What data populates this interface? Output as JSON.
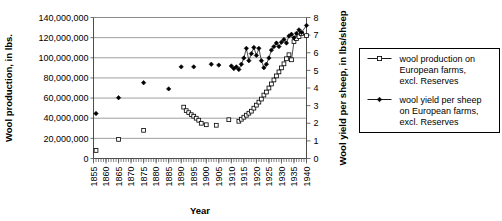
{
  "chart_data": {
    "type": "scatter",
    "title": "",
    "xlabel": "Year",
    "ylabel": "Wool production, in lbs.",
    "y2label": "Wool yield per sheep, in lbs/sheep",
    "xlim": [
      1855,
      1940
    ],
    "ylim": [
      0,
      140000000
    ],
    "y2lim": [
      0,
      8
    ],
    "grid": true,
    "legend_position": "right",
    "x_ticks": [
      1855,
      1860,
      1865,
      1870,
      1875,
      1880,
      1885,
      1890,
      1895,
      1900,
      1905,
      1910,
      1915,
      1920,
      1925,
      1930,
      1935,
      1940
    ],
    "x_tick_labels": [
      "1855",
      "1860",
      "1865",
      "1870",
      "1875",
      "1880",
      "1885",
      "1890",
      "1895",
      "1900",
      "1905",
      "1910",
      "1915",
      "1920",
      "1925",
      "1930",
      "1935",
      "1940"
    ],
    "x_minor_tick_step": 1,
    "y_ticks": [
      0,
      20000000,
      40000000,
      60000000,
      80000000,
      100000000,
      120000000,
      140000000
    ],
    "y_tick_labels": [
      "0",
      "20,000,000",
      "40,000,000",
      "60,000,000",
      "80,000,000",
      "100,000,000",
      "120,000,000",
      "140,000,000"
    ],
    "y2_ticks": [
      0,
      1,
      2,
      3,
      4,
      5,
      6,
      7,
      8
    ],
    "y2_tick_labels": [
      "0",
      "1",
      "2",
      "3",
      "4",
      "5",
      "6",
      "7",
      "8"
    ],
    "series": [
      {
        "name": "wool production on European farms, excl. Reserves",
        "axis": "left",
        "marker": "open-square",
        "connected": true,
        "points": [
          [
            1856,
            8000000
          ],
          [
            1865,
            19000000
          ],
          [
            1875,
            28000000
          ],
          [
            1891,
            51000000
          ],
          [
            1892,
            47500000
          ],
          [
            1893,
            45500000
          ],
          [
            1894,
            43500000
          ],
          [
            1895,
            42000000
          ],
          [
            1896,
            40000000
          ],
          [
            1897,
            38000000
          ],
          [
            1898,
            35000000
          ],
          [
            1900,
            33500000
          ],
          [
            1904,
            33000000
          ],
          [
            1909,
            38500000
          ],
          [
            1913,
            37000000
          ],
          [
            1914,
            39000000
          ],
          [
            1915,
            41000000
          ],
          [
            1916,
            43000000
          ],
          [
            1917,
            45000000
          ],
          [
            1918,
            47000000
          ],
          [
            1919,
            50000000
          ],
          [
            1920,
            53000000
          ],
          [
            1921,
            56000000
          ],
          [
            1922,
            59000000
          ],
          [
            1923,
            63000000
          ],
          [
            1924,
            66000000
          ],
          [
            1925,
            70000000
          ],
          [
            1926,
            74000000
          ],
          [
            1927,
            78000000
          ],
          [
            1928,
            82000000
          ],
          [
            1929,
            86000000
          ],
          [
            1930,
            90000000
          ],
          [
            1931,
            94000000
          ],
          [
            1932,
            99000000
          ],
          [
            1933,
            103000000
          ],
          [
            1934,
            98000000
          ],
          [
            1935,
            116000000
          ],
          [
            1936,
            119000000
          ],
          [
            1937,
            121000000
          ],
          [
            1938,
            124000000
          ],
          [
            1940,
            122000000
          ]
        ]
      },
      {
        "name": "wool yield per sheep on European farms, excl. Reserves",
        "axis": "right",
        "marker": "filled-diamond",
        "connected": true,
        "points": [
          [
            1856,
            2.55
          ],
          [
            1865,
            3.45
          ],
          [
            1875,
            4.3
          ],
          [
            1885,
            3.95
          ],
          [
            1890,
            5.2
          ],
          [
            1895,
            5.2
          ],
          [
            1902,
            5.35
          ],
          [
            1905,
            5.3
          ],
          [
            1910,
            5.25
          ],
          [
            1911,
            5.1
          ],
          [
            1912,
            5.2
          ],
          [
            1913,
            5.05
          ],
          [
            1914,
            5.35
          ],
          [
            1915,
            5.7
          ],
          [
            1916,
            6.25
          ],
          [
            1917,
            5.55
          ],
          [
            1918,
            5.95
          ],
          [
            1919,
            6.3
          ],
          [
            1920,
            5.85
          ],
          [
            1921,
            6.25
          ],
          [
            1922,
            5.55
          ],
          [
            1923,
            5.15
          ],
          [
            1924,
            5.35
          ],
          [
            1925,
            5.7
          ],
          [
            1926,
            6.15
          ],
          [
            1927,
            6.35
          ],
          [
            1928,
            6.55
          ],
          [
            1929,
            6.35
          ],
          [
            1930,
            6.6
          ],
          [
            1931,
            6.75
          ],
          [
            1932,
            6.55
          ],
          [
            1933,
            6.95
          ],
          [
            1934,
            7.05
          ],
          [
            1935,
            6.85
          ],
          [
            1936,
            7.1
          ],
          [
            1937,
            7.3
          ],
          [
            1938,
            7.15
          ],
          [
            1940,
            7.55
          ]
        ]
      }
    ]
  },
  "legend": {
    "entries": [
      {
        "marker": "open-square",
        "lines": [
          "wool production on",
          "European farms,",
          "excl. Reserves"
        ]
      },
      {
        "marker": "filled-diamond",
        "lines": [
          "wool yield per sheep",
          "on European farms,",
          "excl. Reserves"
        ]
      }
    ]
  }
}
